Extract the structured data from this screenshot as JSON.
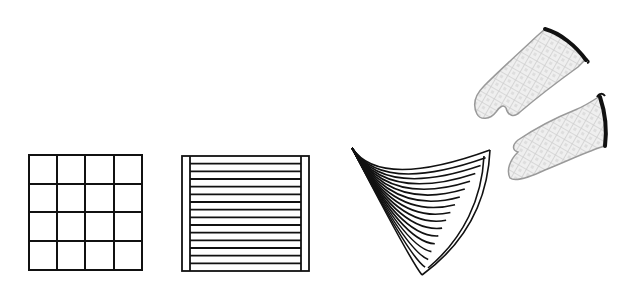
{
  "scene": {
    "background": "#ffffff",
    "stroke_color": "#111111",
    "glove_fill": "#eeeeee",
    "glove_pattern": "#cfcfcf",
    "glove_outline": "#9a9a9a",
    "glove_cuff": "#111111"
  },
  "items": [
    {
      "id": "grid-pot-holder",
      "label": "Square grid pot holder",
      "rows": 4,
      "cols": 4
    },
    {
      "id": "striped-pot-holder",
      "label": "Striped pot holder",
      "stripes": 14
    },
    {
      "id": "fan-shape",
      "label": "Curved fan / folded shape",
      "ribs": 16
    },
    {
      "id": "oven-mitts",
      "label": "Pair of quilted oven mitts",
      "count": 2
    }
  ]
}
